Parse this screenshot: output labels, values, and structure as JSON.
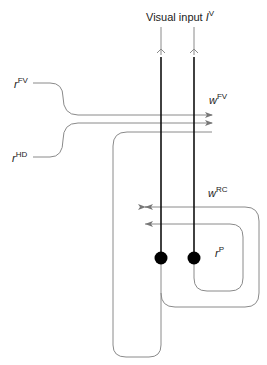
{
  "diagram": {
    "title_label": {
      "text": "Visual input ",
      "symbol": "I",
      "superscript": "V"
    },
    "inputs": [
      {
        "symbol": "r",
        "superscript": "FV"
      },
      {
        "symbol": "r",
        "superscript": "HD"
      }
    ],
    "weights": [
      {
        "symbol": "w",
        "superscript": "FV"
      },
      {
        "symbol": "w",
        "superscript": "RC"
      }
    ],
    "population": {
      "symbol": "r",
      "superscript": "P"
    },
    "colors": {
      "axon": "#111111",
      "wire": "#8a8a8a",
      "neuron": "#000000"
    }
  }
}
